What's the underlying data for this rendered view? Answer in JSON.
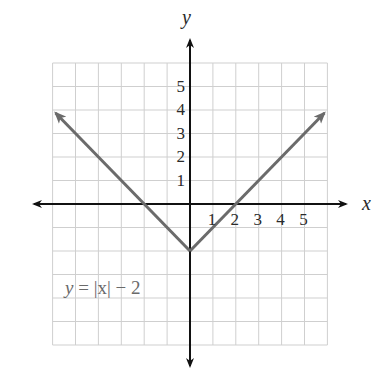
{
  "chart_data": {
    "type": "line",
    "title": "",
    "xlabel": "x",
    "ylabel": "y",
    "xlim": [
      -6,
      6
    ],
    "ylim": [
      -6,
      6
    ],
    "grid": true,
    "x_ticks": [
      "1",
      "2",
      "3",
      "4",
      "5"
    ],
    "y_ticks": [
      "1",
      "2",
      "3",
      "4",
      "5"
    ],
    "series": [
      {
        "name": "y = |x| − 2",
        "x": [
          -6,
          -2,
          0,
          2,
          6
        ],
        "y": [
          4,
          0,
          -2,
          0,
          4
        ]
      }
    ],
    "annotations": [
      {
        "text": "y = |x| − 2",
        "x": -5.5,
        "y": -3.5
      }
    ],
    "colors": {
      "curve": "#6b6b6b",
      "axes": "#111111",
      "grid": "#cfcfcf"
    }
  },
  "labels": {
    "x_axis": "x",
    "y_axis": "y",
    "equation_var": "y",
    "equation_rest": " = |x| − 2"
  }
}
